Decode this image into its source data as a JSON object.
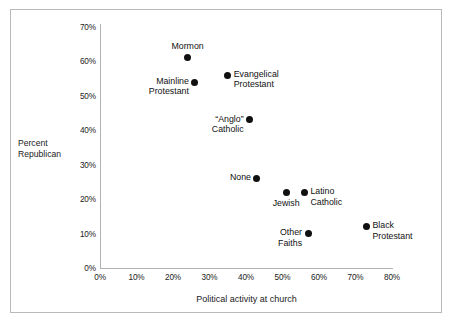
{
  "chart_data": {
    "type": "scatter",
    "title": "",
    "xlabel": "Political activity at church",
    "ylabel": "Percent Republican",
    "xlim": [
      0,
      80
    ],
    "ylim": [
      0,
      70
    ],
    "xticks": [
      "0%",
      "10%",
      "20%",
      "30%",
      "40%",
      "50%",
      "60%",
      "70%",
      "80%"
    ],
    "xtick_values": [
      0,
      10,
      20,
      30,
      40,
      50,
      60,
      70,
      80
    ],
    "yticks": [
      "0%",
      "10%",
      "20%",
      "30%",
      "40%",
      "50%",
      "60%",
      "70%"
    ],
    "ytick_values": [
      0,
      10,
      20,
      30,
      40,
      50,
      60,
      70
    ],
    "grid": false,
    "legend": "none",
    "marker_color": "#101010",
    "points": [
      {
        "label": "Mormon",
        "x": 24,
        "y": 61,
        "label_pos": "above",
        "lines": [
          "Mormon"
        ]
      },
      {
        "label": "Mainline Protestant",
        "x": 26,
        "y": 54,
        "label_pos": "left-below",
        "lines": [
          "Mainline",
          "Protestant"
        ]
      },
      {
        "label": "Evangelical Protestant",
        "x": 35,
        "y": 56,
        "label_pos": "right",
        "lines": [
          "Evangelical",
          "Protestant"
        ]
      },
      {
        "label": "“Anglo” Catholic",
        "x": 41,
        "y": 43,
        "label_pos": "left-below",
        "lines": [
          "“Anglo”",
          "Catholic"
        ]
      },
      {
        "label": "None",
        "x": 43,
        "y": 26,
        "label_pos": "left",
        "lines": [
          "None"
        ]
      },
      {
        "label": "Jewish",
        "x": 51,
        "y": 22,
        "label_pos": "below",
        "lines": [
          "Jewish"
        ]
      },
      {
        "label": "Latino Catholic",
        "x": 56,
        "y": 22,
        "label_pos": "right-below",
        "lines": [
          "Latino",
          "Catholic"
        ]
      },
      {
        "label": "Other Faiths",
        "x": 57,
        "y": 10,
        "label_pos": "left-below",
        "lines": [
          "Other",
          "Faiths"
        ]
      },
      {
        "label": "Black Protestant",
        "x": 73,
        "y": 12,
        "label_pos": "right-below",
        "lines": [
          "Black",
          "Protestant"
        ]
      }
    ]
  },
  "axes": {
    "y_title_line1": "Percent",
    "y_title_line2": "Republican",
    "x_title": "Political activity at church"
  },
  "colors": {
    "marker": "#101010",
    "axis": "#b2b2b2",
    "frame": "#b9b9b9",
    "text": "#1a1a1a",
    "background": "#ffffff"
  }
}
